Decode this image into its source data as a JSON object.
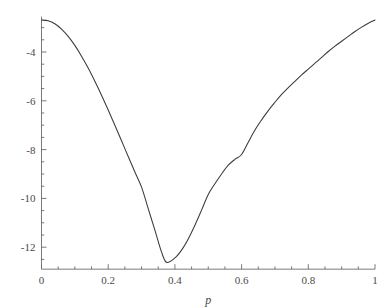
{
  "chart_data": {
    "type": "line",
    "title": "",
    "subtitle": "",
    "xlabel": "p",
    "ylabel": "",
    "xlim": [
      0,
      1
    ],
    "ylim": [
      -12.9,
      -2.55
    ],
    "grid": false,
    "legend": null,
    "annotations": [],
    "axis_color": "#6b6b6b",
    "curve_color": "#3a3a3a",
    "background": "#ffffff",
    "x_ticks_major": [
      0,
      0.2,
      0.4,
      0.6,
      0.8,
      1
    ],
    "x_tick_labels": [
      "0",
      "0.2",
      "0.4",
      "0.6",
      "0.8",
      "1"
    ],
    "x_ticks_minor": [
      0.05,
      0.1,
      0.15,
      0.25,
      0.3,
      0.35,
      0.45,
      0.5,
      0.55,
      0.65,
      0.7,
      0.75,
      0.85,
      0.9,
      0.95
    ],
    "y_ticks_major": [
      -4,
      -6,
      -8,
      -10,
      -12
    ],
    "y_tick_labels": [
      "-4",
      "-6",
      "-8",
      "-10",
      "-12"
    ],
    "y_ticks_minor": [
      -3,
      -3.5,
      -4.5,
      -5,
      -5.5,
      -6.5,
      -7,
      -7.5,
      -8.5,
      -9,
      -9.5,
      -10.5,
      -11,
      -11.5,
      -12.5
    ],
    "minimum": {
      "x": 0.375,
      "y": -12.62
    },
    "series": [
      {
        "name": "log-likelihood",
        "x": [
          0.0,
          0.02,
          0.04,
          0.06,
          0.08,
          0.1,
          0.12,
          0.14,
          0.16,
          0.18,
          0.2,
          0.22,
          0.24,
          0.26,
          0.28,
          0.3,
          0.32,
          0.34,
          0.36,
          0.375,
          0.4,
          0.42,
          0.44,
          0.46,
          0.48,
          0.5,
          0.52,
          0.54,
          0.56,
          0.58,
          0.6,
          0.62,
          0.64,
          0.66,
          0.68,
          0.7,
          0.72,
          0.74,
          0.76,
          0.78,
          0.8,
          0.82,
          0.84,
          0.86,
          0.88,
          0.9,
          0.92,
          0.94,
          0.96,
          0.98,
          1.0
        ],
        "y": [
          -2.69,
          -2.72,
          -2.84,
          -3.06,
          -3.36,
          -3.73,
          -4.17,
          -4.66,
          -5.2,
          -5.77,
          -6.38,
          -7.0,
          -7.64,
          -8.28,
          -8.92,
          -9.54,
          -10.42,
          -11.3,
          -12.2,
          -12.62,
          -12.44,
          -12.12,
          -11.66,
          -11.1,
          -10.48,
          -9.84,
          -9.4,
          -9.0,
          -8.64,
          -8.4,
          -8.2,
          -7.7,
          -7.2,
          -6.78,
          -6.4,
          -6.06,
          -5.74,
          -5.46,
          -5.2,
          -4.94,
          -4.7,
          -4.46,
          -4.22,
          -3.98,
          -3.76,
          -3.56,
          -3.36,
          -3.16,
          -2.98,
          -2.82,
          -2.69
        ]
      }
    ]
  }
}
